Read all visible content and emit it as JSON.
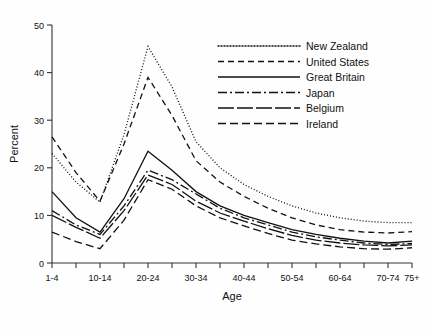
{
  "chart_data": {
    "type": "line",
    "title": "",
    "xlabel": "Age",
    "ylabel": "Percent",
    "ylim": [
      0,
      50
    ],
    "yticks": [
      0,
      10,
      20,
      30,
      40,
      50
    ],
    "grid": false,
    "legend_position": "top-right",
    "categories": [
      "1-4",
      "5-9",
      "10-14",
      "15-19",
      "20-24",
      "25-29",
      "30-34",
      "35-39",
      "40-44",
      "45-49",
      "50-54",
      "55-59",
      "60-64",
      "65-69",
      "70-74",
      "75+"
    ],
    "tick_labels": [
      "1-4",
      "10-14",
      "20-24",
      "30-34",
      "40-44",
      "50-54",
      "60-64",
      "70-74",
      "75+"
    ],
    "series": [
      {
        "name": "New Zealand",
        "style": "dotted",
        "values": [
          23.0,
          17.0,
          12.8,
          27.0,
          45.5,
          37.0,
          25.5,
          20.0,
          16.5,
          14.0,
          12.0,
          10.5,
          9.5,
          8.8,
          8.5,
          8.5
        ]
      },
      {
        "name": "United States",
        "style": "dashed",
        "values": [
          26.5,
          19.0,
          13.0,
          25.0,
          39.0,
          31.0,
          21.5,
          17.0,
          14.0,
          11.5,
          9.5,
          8.0,
          7.0,
          6.5,
          6.3,
          6.6
        ]
      },
      {
        "name": "Great Britain",
        "style": "solid",
        "values": [
          15.0,
          9.5,
          6.5,
          13.5,
          23.5,
          19.5,
          15.0,
          12.0,
          10.0,
          8.5,
          7.0,
          6.0,
          5.2,
          4.6,
          4.2,
          4.6
        ]
      },
      {
        "name": "Japan",
        "style": "dash-dot",
        "values": [
          11.0,
          8.0,
          6.0,
          12.0,
          19.5,
          17.5,
          14.5,
          11.5,
          9.5,
          8.0,
          6.5,
          5.5,
          4.8,
          4.2,
          3.9,
          4.1
        ]
      },
      {
        "name": "Belgium",
        "style": "long-dash",
        "values": [
          10.0,
          7.5,
          5.2,
          11.0,
          18.5,
          16.5,
          13.0,
          10.5,
          8.8,
          7.2,
          5.8,
          4.8,
          4.2,
          3.8,
          3.6,
          3.8
        ]
      },
      {
        "name": "Ireland",
        "style": "medium-dash",
        "values": [
          6.5,
          4.5,
          3.0,
          9.0,
          17.5,
          15.5,
          12.0,
          9.5,
          7.8,
          6.2,
          4.8,
          4.0,
          3.4,
          3.0,
          2.9,
          3.2
        ]
      }
    ]
  },
  "legend": {
    "entries": [
      {
        "label": "New Zealand"
      },
      {
        "label": "United States"
      },
      {
        "label": "Great Britain"
      },
      {
        "label": "Japan"
      },
      {
        "label": "Belgium"
      },
      {
        "label": "Ireland"
      }
    ]
  },
  "colors": {
    "ink": "#111111",
    "background": "#ffffff"
  }
}
